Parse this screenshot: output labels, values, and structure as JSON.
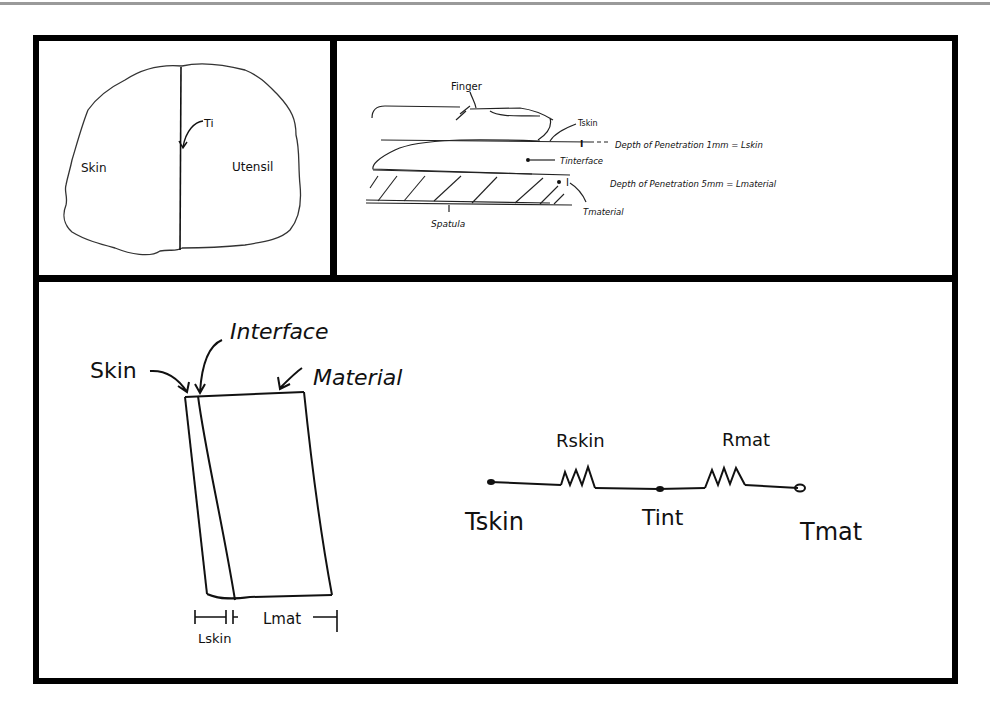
{
  "panels": {
    "contact_region": {
      "left_label": "Skin",
      "right_label": "Utensil",
      "interface_label": "Ti"
    },
    "finger_on_spatula": {
      "finger_label": "Finger",
      "t_skin_label": "Tskin",
      "skin_depth_note": "Depth of Penetration  1mm = Lskin",
      "t_interface_label": "Tinterface",
      "material_depth_note": "Depth of Penetration  5mm = Lmaterial",
      "t_material_label": "Tmaterial",
      "spatula_label": "Spatula"
    },
    "layer_model": {
      "skin_label": "Skin",
      "interface_label": "Interface",
      "material_label": "Material",
      "l_skin_label": "Lskin",
      "l_mat_label": "Lmat"
    },
    "resistance_circuit": {
      "r_skin_label": "Rskin",
      "r_mat_label": "Rmat",
      "t_skin_label": "Tskin",
      "t_int_label": "Tint",
      "t_mat_label": "Tmat",
      "nodes": [
        "Tskin",
        "Tint",
        "Tmat"
      ],
      "resistors": [
        "Rskin",
        "Rmat"
      ]
    }
  },
  "colors": {
    "ink": "#111111",
    "frame": "#000000",
    "rule": "#9a9a9a",
    "background": "#ffffff"
  }
}
